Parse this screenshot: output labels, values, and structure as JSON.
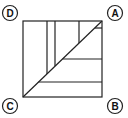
{
  "diagram": {
    "type": "geometric-figure",
    "stroke_color": "#222222",
    "background": "#ffffff",
    "square": {
      "x1": 23,
      "y1": 21,
      "x2": 102,
      "y2": 97
    },
    "diagonal": {
      "from": "C",
      "to": "A"
    },
    "vertical_lines_x": [
      47,
      55,
      79
    ],
    "horizontal_lines_y": [
      28,
      59,
      82
    ],
    "labels": [
      {
        "text": "D",
        "corner": "top-left"
      },
      {
        "text": "A",
        "corner": "top-right"
      },
      {
        "text": "C",
        "corner": "bottom-left"
      },
      {
        "text": "B",
        "corner": "bottom-right"
      }
    ]
  }
}
